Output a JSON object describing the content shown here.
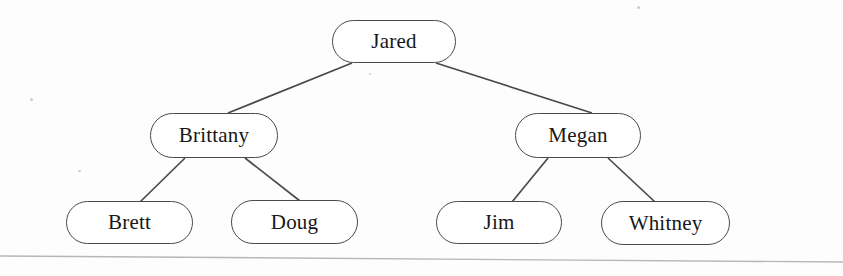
{
  "diagram": {
    "type": "binary-tree",
    "title": "",
    "node_shape": "stadium",
    "line_color": "#4a4a4a",
    "text_color": "#171717",
    "background_color": "#fdfdfd",
    "nodes": [
      {
        "id": "jared",
        "label": "Jared",
        "level": 0,
        "x": 332,
        "y": 20,
        "w": 124,
        "h": 43,
        "font_size": 21
      },
      {
        "id": "brittany",
        "label": "Brittany",
        "level": 1,
        "x": 150,
        "y": 113,
        "w": 128,
        "h": 45,
        "font_size": 21
      },
      {
        "id": "megan",
        "label": "Megan",
        "level": 1,
        "x": 515,
        "y": 113,
        "w": 126,
        "h": 45,
        "font_size": 21
      },
      {
        "id": "brett",
        "label": "Brett",
        "level": 2,
        "x": 66,
        "y": 201,
        "w": 127,
        "h": 43,
        "font_size": 21
      },
      {
        "id": "doug",
        "label": "Doug",
        "level": 2,
        "x": 231,
        "y": 200,
        "w": 127,
        "h": 44,
        "font_size": 21
      },
      {
        "id": "jim",
        "label": "Jim",
        "level": 2,
        "x": 436,
        "y": 201,
        "w": 126,
        "h": 43,
        "font_size": 21
      },
      {
        "id": "whitney",
        "label": "Whitney",
        "level": 2,
        "x": 601,
        "y": 201,
        "w": 129,
        "h": 44,
        "font_size": 21
      }
    ],
    "edges": [
      {
        "from": "jared",
        "to": "brittany",
        "x1": 352,
        "y1": 63,
        "x2": 228,
        "y2": 113
      },
      {
        "from": "jared",
        "to": "megan",
        "x1": 436,
        "y1": 63,
        "x2": 592,
        "y2": 113
      },
      {
        "from": "brittany",
        "to": "brett",
        "x1": 185,
        "y1": 158,
        "x2": 140,
        "y2": 202
      },
      {
        "from": "brittany",
        "to": "doug",
        "x1": 245,
        "y1": 158,
        "x2": 300,
        "y2": 201
      },
      {
        "from": "megan",
        "to": "jim",
        "x1": 548,
        "y1": 158,
        "x2": 512,
        "y2": 202
      },
      {
        "from": "megan",
        "to": "whitney",
        "x1": 608,
        "y1": 158,
        "x2": 655,
        "y2": 202
      }
    ],
    "scan_line": {
      "name": "page-edge-scan-line",
      "x1": 0,
      "y1": 256,
      "x2": 843,
      "y2": 262,
      "color": "#b7b7b7"
    }
  }
}
